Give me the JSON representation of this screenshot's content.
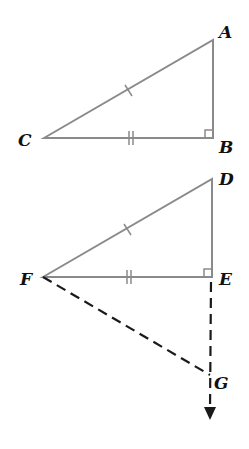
{
  "diagram": {
    "type": "geometry",
    "colors": {
      "solid_line": "#8a8a8a",
      "dashed_line": "#1a1a1a",
      "label": "#111111"
    },
    "triangle_abc": {
      "vertices": {
        "A": [
          213,
          40
        ],
        "B": [
          213,
          138
        ],
        "C": [
          44,
          138
        ]
      },
      "labels": {
        "A": "A",
        "B": "B",
        "C": "C"
      },
      "right_angle_at": "B",
      "congruence_marks": {
        "CA": 1,
        "CB": 2
      }
    },
    "triangle_def": {
      "vertices": {
        "D": [
          212,
          179
        ],
        "E": [
          212,
          277
        ],
        "F": [
          43,
          277
        ]
      },
      "labels": {
        "D": "D",
        "E": "E",
        "F": "F"
      },
      "right_angle_at": "E",
      "congruence_marks": {
        "FD": 1,
        "FE": 2
      }
    },
    "construction": {
      "point_G": [
        210,
        378
      ],
      "label_G": "G",
      "dashed_segments": [
        "FG",
        "EG"
      ],
      "ray": "E→G extended downward with arrow"
    }
  }
}
